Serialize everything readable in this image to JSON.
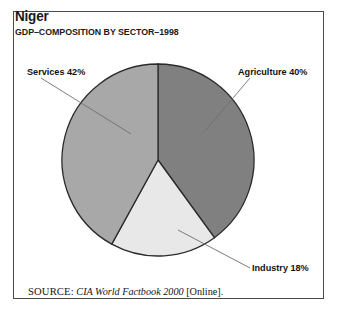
{
  "figure": {
    "title": "Niger",
    "subtitle": "GDP–COMPOSITION BY SECTOR–1998",
    "frame_border_color": "#4a4a4a",
    "background_color": "#ffffff"
  },
  "source": {
    "kicker": "SOURCE:",
    "work": "CIA World Factbook 2000",
    "medium": "[Online]."
  },
  "labels": {
    "services": "Services 42%",
    "agriculture": "Agriculture 40%",
    "industry": "Industry 18%"
  },
  "chart_data": {
    "type": "pie",
    "title": "Niger",
    "subtitle": "GDP–COMPOSITION BY SECTOR–1998",
    "xlabel": "",
    "ylabel": "",
    "unit": "percent",
    "total": 100,
    "grid": false,
    "legend_position": "none",
    "label_style": "external callout with leader line",
    "start_angle_deg": 0,
    "direction": "clockwise",
    "categories": [
      "Agriculture",
      "Industry",
      "Services"
    ],
    "values": [
      40,
      18,
      42
    ],
    "slices": [
      {
        "name": "Agriculture",
        "value": 40,
        "label": "Agriculture 40%",
        "color": "#808080",
        "start_deg": 0,
        "end_deg": 144
      },
      {
        "name": "Industry",
        "value": 18,
        "label": "Industry 18%",
        "color": "#e8e8e8",
        "start_deg": 144,
        "end_deg": 208.8
      },
      {
        "name": "Services",
        "value": 42,
        "label": "Services 42%",
        "color": "#a8a8a8",
        "start_deg": 208.8,
        "end_deg": 360
      }
    ],
    "annotations": [
      "SOURCE: CIA World Factbook 2000 [Online]."
    ]
  },
  "geometry": {
    "center_x": 158,
    "center_y": 160,
    "radius": 96,
    "outline_color": "#2b2b2b",
    "leader_color": "#6e6e6e"
  }
}
